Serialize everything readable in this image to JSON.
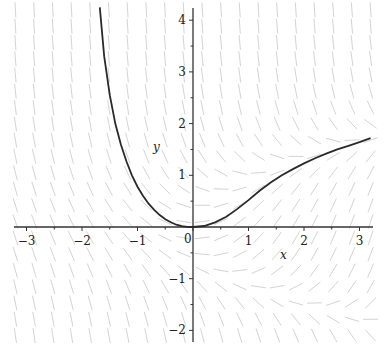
{
  "chart_data": {
    "type": "line",
    "title": "",
    "xlabel": "x",
    "ylabel": "y",
    "xlim": [
      -3.25,
      3.25
    ],
    "ylim": [
      -2.2,
      4.3
    ],
    "xticks": [
      -3,
      -2,
      -1,
      0,
      1,
      2,
      3
    ],
    "yticks": [
      -2,
      -1,
      1,
      2,
      3,
      4
    ],
    "grid": false,
    "legend": null,
    "slope_field": {
      "description": "direction field of the ODE (approximately dy/dx = x - y^2)",
      "color": "#d4d4d4",
      "x_range": [
        -3.2,
        3.2
      ],
      "y_range": [
        -2.1,
        4.2
      ],
      "nx": 20,
      "ny": 21
    },
    "series": [
      {
        "name": "solution curve y(0)=0",
        "color": "#2a2a2a",
        "x": [
          -1.68,
          -1.6,
          -1.5,
          -1.4,
          -1.3,
          -1.2,
          -1.1,
          -1.0,
          -0.9,
          -0.8,
          -0.7,
          -0.6,
          -0.5,
          -0.4,
          -0.3,
          -0.2,
          -0.1,
          0.0,
          0.2,
          0.4,
          0.6,
          0.8,
          1.0,
          1.2,
          1.4,
          1.6,
          1.8,
          2.0,
          2.2,
          2.4,
          2.6,
          2.8,
          3.0,
          3.2
        ],
        "values": [
          4.25,
          3.3,
          2.55,
          2.0,
          1.6,
          1.27,
          1.0,
          0.78,
          0.6,
          0.45,
          0.33,
          0.23,
          0.15,
          0.09,
          0.045,
          0.015,
          0.003,
          0.0,
          0.02,
          0.09,
          0.2,
          0.35,
          0.52,
          0.7,
          0.86,
          1.0,
          1.12,
          1.23,
          1.33,
          1.42,
          1.5,
          1.57,
          1.64,
          1.72
        ]
      }
    ]
  },
  "labels": {
    "x_axis": "x",
    "y_axis": "y",
    "x_ticks": [
      "−3",
      "−2",
      "−1",
      "0",
      "1",
      "2",
      "3"
    ],
    "y_ticks": [
      "−2",
      "−1",
      "1",
      "2",
      "3",
      "4"
    ]
  }
}
